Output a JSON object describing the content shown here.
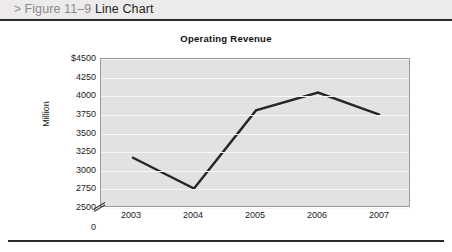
{
  "header": {
    "chevron": ">",
    "figure_number": "Figure 11–9",
    "figure_title": "Line Chart"
  },
  "chart_data": {
    "type": "line",
    "title": "Operating Revenue",
    "xlabel": "",
    "ylabel": "Million",
    "categories": [
      "2003",
      "2004",
      "2005",
      "2006",
      "2007"
    ],
    "values": [
      3180,
      2760,
      3810,
      4050,
      3750
    ],
    "series": [
      {
        "name": "Operating Revenue",
        "values": [
          3180,
          2760,
          3810,
          4050,
          3750
        ]
      }
    ],
    "ylim": [
      2500,
      4500
    ],
    "ytick_labels": [
      "$4500",
      "4250",
      "4000",
      "3750",
      "3500",
      "3250",
      "3000",
      "2750",
      "2500",
      "0"
    ],
    "ytick_values": [
      4500,
      4250,
      4000,
      3750,
      3500,
      3250,
      3000,
      2750,
      2500,
      0
    ],
    "axis_break": true,
    "axis_break_label": "0",
    "grid": true,
    "legend": "none",
    "line_color": "#262626",
    "plot_background": "#e2e2e2",
    "gridline_color": "#f7f7f7"
  }
}
